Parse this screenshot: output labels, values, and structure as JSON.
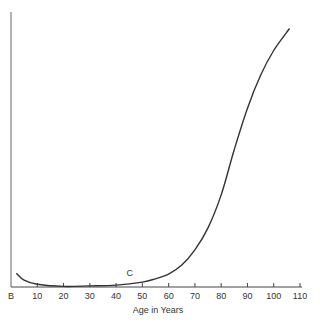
{
  "chart_data": {
    "type": "line",
    "title": "",
    "xlabel": "Age in Years",
    "ylabel": "",
    "x_tick_labels": [
      "B",
      "10",
      "20",
      "30",
      "40",
      "50",
      "60",
      "70",
      "80",
      "90",
      "100",
      "110"
    ],
    "x_ticks": [
      0,
      10,
      20,
      30,
      40,
      50,
      60,
      70,
      80,
      90,
      100,
      110
    ],
    "xlim": [
      0,
      110
    ],
    "ylim": [
      0,
      100
    ],
    "grid": false,
    "legend": null,
    "annotations": [
      {
        "text": "C",
        "x": 44,
        "y": 4
      }
    ],
    "series": [
      {
        "name": "C",
        "x": [
          2,
          5,
          10,
          20,
          30,
          40,
          50,
          55,
          60,
          65,
          70,
          75,
          80,
          85,
          90,
          95,
          100,
          106
        ],
        "y": [
          5,
          2.5,
          1,
          0.2,
          0.4,
          0.7,
          1.8,
          3,
          4.7,
          8,
          13.5,
          21.5,
          33.5,
          50,
          65,
          77,
          86,
          94
        ]
      }
    ]
  }
}
